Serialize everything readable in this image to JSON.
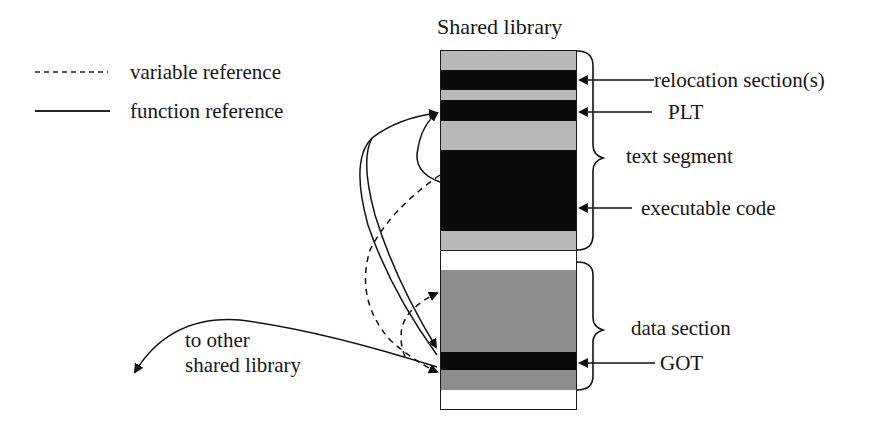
{
  "title": "Shared library",
  "legend": {
    "items": [
      {
        "style": "dashed",
        "label": "variable reference"
      },
      {
        "style": "solid",
        "label": "function reference"
      }
    ]
  },
  "library_segments": [
    {
      "name": "reloc-pad-top",
      "top": 51,
      "height": 19,
      "color": "#b8b8b8"
    },
    {
      "name": "relocation-sections",
      "top": 70,
      "height": 20,
      "color": "#0a0a0a"
    },
    {
      "name": "pad-1",
      "top": 90,
      "height": 10,
      "color": "#b8b8b8"
    },
    {
      "name": "plt",
      "top": 100,
      "height": 21,
      "color": "#0a0a0a"
    },
    {
      "name": "pad-2",
      "top": 121,
      "height": 29,
      "color": "#b8b8b8"
    },
    {
      "name": "executable-code",
      "top": 150,
      "height": 81,
      "color": "#0a0a0a"
    },
    {
      "name": "pad-3",
      "top": 231,
      "height": 19,
      "color": "#b8b8b8"
    },
    {
      "name": "gap",
      "top": 250,
      "height": 20,
      "color": "#ffffff"
    },
    {
      "name": "data-upper",
      "top": 270,
      "height": 82,
      "color": "#8e8e8e"
    },
    {
      "name": "got",
      "top": 352,
      "height": 18,
      "color": "#0a0a0a"
    },
    {
      "name": "data-lower",
      "top": 370,
      "height": 20,
      "color": "#8e8e8e"
    },
    {
      "name": "bottom-empty",
      "top": 390,
      "height": 20,
      "color": "#ffffff"
    }
  ],
  "annotations": {
    "relocation": "relocation section(s)",
    "plt": "PLT",
    "text_segment": "text segment",
    "executable_code": "executable code",
    "data_section": "data section",
    "got": "GOT",
    "other_library_line1": "to other",
    "other_library_line2": "shared library"
  },
  "colors": {
    "ink": "#151515",
    "light_gray": "#b8b8b8",
    "mid_gray": "#8e8e8e",
    "black": "#0a0a0a"
  }
}
